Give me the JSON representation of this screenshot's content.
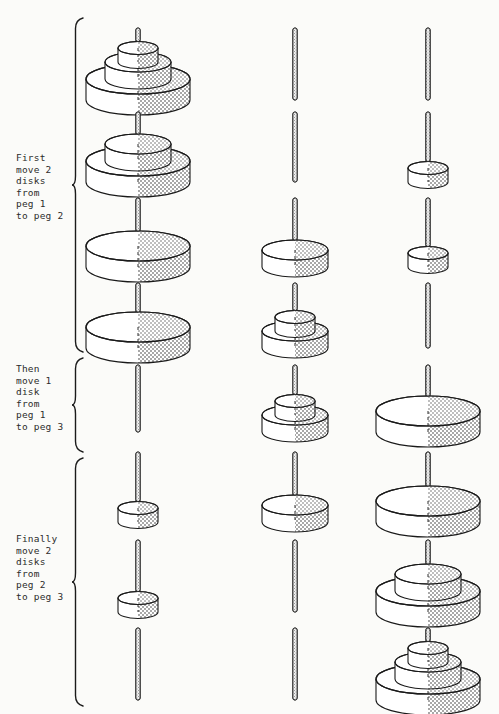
{
  "figure": {
    "background_color": "#fbfbf9",
    "ink_color": "#1a1a1a",
    "shade_color": "#b9b9b9",
    "peg_count": 3,
    "disk_count": 3,
    "row_count": 8
  },
  "captions": [
    {
      "id": "caption-first",
      "lines": [
        "First",
        "move 2",
        "disks",
        "from",
        "peg 1",
        "to peg 2"
      ],
      "text": "First move 2 disks from peg 1 to peg 2",
      "x": 16,
      "y": 152,
      "brace": {
        "top": 18,
        "bottom": 352,
        "x": 72
      }
    },
    {
      "id": "caption-then",
      "lines": [
        "Then",
        "move 1",
        "disk",
        "from",
        "peg 1",
        "to peg 3"
      ],
      "text": "Then move 1 disk from peg 1 to peg 3",
      "x": 16,
      "y": 363,
      "brace": {
        "top": 358,
        "bottom": 452,
        "x": 72
      }
    },
    {
      "id": "caption-finally",
      "lines": [
        "Finally",
        "move 2",
        "disks",
        "from",
        "peg 2",
        "to peg 3"
      ],
      "text": "Finally move 2 disks from peg 2 to peg 3",
      "x": 16,
      "y": 533,
      "brace": {
        "top": 458,
        "bottom": 706,
        "x": 72
      }
    }
  ],
  "disk_sizes": {
    "large": {
      "name": "large",
      "rx": 52,
      "ry": 15,
      "h": 21
    },
    "medium": {
      "name": "medium",
      "rx": 33,
      "ry": 10,
      "h": 17
    },
    "small": {
      "name": "small",
      "rx": 20,
      "ry": 6.5,
      "h": 14
    }
  },
  "peg_x": [
    138,
    295,
    428
  ],
  "rows": [
    {
      "index": 1,
      "baseline": 100,
      "peg_top": 28,
      "pegs": [
        {
          "peg": 1,
          "disks": [
            "large",
            "medium",
            "small"
          ]
        },
        {
          "peg": 2,
          "disks": []
        },
        {
          "peg": 3,
          "disks": []
        }
      ]
    },
    {
      "index": 2,
      "baseline": 182,
      "peg_top": 112,
      "pegs": [
        {
          "peg": 1,
          "disks": [
            "large",
            "medium"
          ]
        },
        {
          "peg": 2,
          "disks": []
        },
        {
          "peg": 3,
          "disks": [
            "small"
          ]
        }
      ]
    },
    {
      "index": 3,
      "baseline": 267,
      "peg_top": 198,
      "pegs": [
        {
          "peg": 1,
          "disks": [
            "large"
          ]
        },
        {
          "peg": 2,
          "disks": [
            "medium"
          ]
        },
        {
          "peg": 3,
          "disks": [
            "small"
          ]
        }
      ]
    },
    {
      "index": 4,
      "baseline": 348,
      "peg_top": 283,
      "pegs": [
        {
          "peg": 1,
          "disks": [
            "large"
          ]
        },
        {
          "peg": 2,
          "disks": [
            "medium",
            "small"
          ]
        },
        {
          "peg": 3,
          "disks": []
        }
      ]
    },
    {
      "index": 5,
      "baseline": 432,
      "peg_top": 365,
      "pegs": [
        {
          "peg": 1,
          "disks": []
        },
        {
          "peg": 2,
          "disks": [
            "medium",
            "small"
          ]
        },
        {
          "peg": 3,
          "disks": [
            "large"
          ]
        }
      ]
    },
    {
      "index": 6,
      "baseline": 522,
      "peg_top": 452,
      "pegs": [
        {
          "peg": 1,
          "disks": [
            "small"
          ]
        },
        {
          "peg": 2,
          "disks": [
            "medium"
          ]
        },
        {
          "peg": 3,
          "disks": [
            "large"
          ]
        }
      ]
    },
    {
      "index": 7,
      "baseline": 612,
      "peg_top": 540,
      "pegs": [
        {
          "peg": 1,
          "disks": [
            "small"
          ]
        },
        {
          "peg": 2,
          "disks": []
        },
        {
          "peg": 3,
          "disks": [
            "large",
            "medium"
          ]
        }
      ]
    },
    {
      "index": 8,
      "baseline": 700,
      "peg_top": 628,
      "pegs": [
        {
          "peg": 1,
          "disks": []
        },
        {
          "peg": 2,
          "disks": []
        },
        {
          "peg": 3,
          "disks": [
            "large",
            "medium",
            "small"
          ]
        }
      ]
    }
  ]
}
